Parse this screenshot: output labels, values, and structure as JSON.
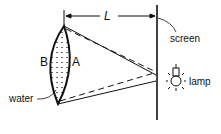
{
  "diagram": {
    "labels": {
      "length": "L",
      "surface_b": "B",
      "surface_a": "A",
      "water": "water",
      "screen": "screen",
      "lamp": "lamp"
    },
    "colors": {
      "ink": "#111111",
      "background": "#ffffff"
    }
  }
}
